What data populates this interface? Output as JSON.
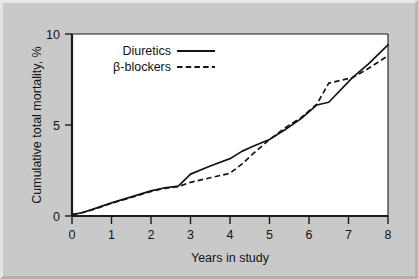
{
  "figure": {
    "background_color": "#c9c9c9",
    "plot_background_color": "#ffffff",
    "line_color": "#151515"
  },
  "chart_data": {
    "type": "line",
    "title": "",
    "xlabel": "Years in study",
    "ylabel": "Cumulative total mortality, %",
    "xlim": [
      0,
      8
    ],
    "ylim": [
      0,
      10
    ],
    "xticks": [
      0,
      1,
      2,
      3,
      4,
      5,
      6,
      7,
      8
    ],
    "xtick_labels": [
      "0",
      "1",
      "2",
      "3",
      "4",
      "5",
      "6",
      "7",
      "8"
    ],
    "yticks": [
      0,
      5,
      10
    ],
    "ytick_labels": [
      "0",
      "5",
      "10"
    ],
    "grid": false,
    "legend_position": "upper left",
    "series": [
      {
        "name": "Diuretics",
        "style": "solid",
        "x": [
          0,
          0.25,
          0.5,
          1.0,
          1.5,
          2.0,
          2.35,
          2.7,
          3.0,
          3.5,
          4.0,
          4.3,
          4.6,
          5.0,
          5.4,
          5.8,
          6.2,
          6.5,
          7.1,
          7.5,
          8.0
        ],
        "values": [
          0.08,
          0.18,
          0.35,
          0.72,
          1.05,
          1.38,
          1.55,
          1.65,
          2.3,
          2.75,
          3.15,
          3.55,
          3.85,
          4.2,
          4.75,
          5.35,
          6.1,
          6.25,
          7.6,
          8.35,
          9.4
        ]
      },
      {
        "name": "β-blockers",
        "style": "dashed",
        "x": [
          0,
          0.25,
          0.5,
          1.0,
          1.5,
          2.0,
          2.35,
          2.7,
          3.0,
          3.5,
          4.0,
          4.3,
          4.6,
          5.0,
          5.4,
          5.8,
          6.2,
          6.5,
          7.1,
          7.5,
          8.0
        ],
        "values": [
          0.08,
          0.18,
          0.33,
          0.7,
          1.02,
          1.35,
          1.52,
          1.62,
          1.85,
          2.1,
          2.35,
          2.85,
          3.45,
          4.2,
          4.85,
          5.4,
          6.15,
          7.3,
          7.6,
          8.1,
          8.8
        ]
      }
    ],
    "legend_entries": [
      {
        "label": "Diuretics",
        "style": "solid"
      },
      {
        "label": "β-blockers",
        "style": "dashed"
      }
    ]
  }
}
